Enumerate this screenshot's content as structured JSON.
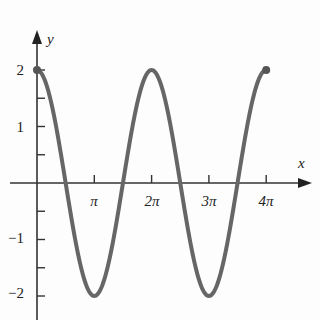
{
  "chart_data": {
    "type": "line",
    "title": "",
    "function": "y = 2cos(x)",
    "xlabel": "x",
    "ylabel": "y",
    "x_tick_labels": [
      "π",
      "2π",
      "3π",
      "4π"
    ],
    "x_tick_values": [
      3.1416,
      6.2832,
      9.4248,
      12.5664
    ],
    "y_tick_labels": [
      "2",
      "1",
      "−1",
      "−2"
    ],
    "y_tick_values": [
      2,
      1,
      -1,
      -2
    ],
    "xlim": [
      0,
      12.5664
    ],
    "ylim": [
      -2.4,
      2.7
    ],
    "grid": false,
    "endpoints": [
      {
        "x": 0,
        "y": 2
      },
      {
        "x": 12.5664,
        "y": 2
      }
    ],
    "series": [
      {
        "name": "2cos(x)",
        "x": [
          0,
          1.5708,
          3.1416,
          4.7124,
          6.2832,
          7.854,
          9.4248,
          10.9956,
          12.5664
        ],
        "values": [
          2,
          0,
          -2,
          0,
          2,
          0,
          -2,
          0,
          2
        ],
        "color": "#666666"
      }
    ]
  },
  "labels": {
    "x_axis": "x",
    "y_axis": "y",
    "xticks": [
      "π",
      "2π",
      "3π",
      "4π"
    ],
    "yticks": [
      "2",
      "1",
      "−1",
      "−2"
    ]
  }
}
